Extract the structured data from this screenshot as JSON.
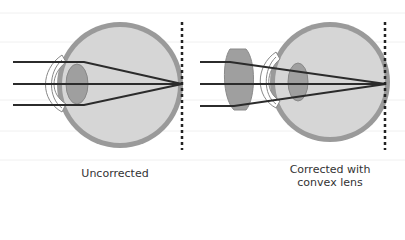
{
  "diagram": {
    "panels": [
      {
        "id": "uncorrected",
        "caption": "Uncorrected"
      },
      {
        "id": "corrected",
        "caption_line1": "Corrected with",
        "caption_line2": "convex lens"
      }
    ],
    "colors": {
      "sclera": "#9a9a9a",
      "vitreous": "#d6d6d6",
      "lens": "#9f9f9f",
      "ray": "#2b2b2b",
      "focal_plane": "#222222",
      "background": "#ffffff"
    }
  }
}
